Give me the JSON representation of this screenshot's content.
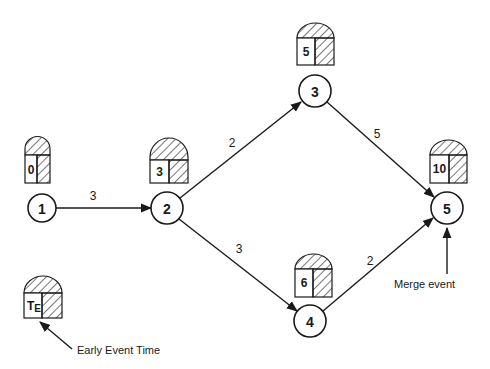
{
  "diagram": {
    "type": "PERT network",
    "nodes": [
      {
        "id": "1",
        "label": "1",
        "cx": 42,
        "cy": 208,
        "early_time": "0",
        "box": {
          "x": 25,
          "y": 136,
          "w": 25
        }
      },
      {
        "id": "2",
        "label": "2",
        "cx": 167,
        "cy": 208,
        "early_time": "3",
        "box": {
          "x": 150,
          "y": 138,
          "w": 38
        }
      },
      {
        "id": "3",
        "label": "3",
        "cx": 315,
        "cy": 92,
        "early_time": "5",
        "box": {
          "x": 297,
          "y": 24,
          "w": 37
        }
      },
      {
        "id": "4",
        "label": "4",
        "cx": 310,
        "cy": 321,
        "early_time": "6",
        "box": {
          "x": 295,
          "y": 252,
          "w": 37
        }
      },
      {
        "id": "5",
        "label": "5",
        "cx": 447,
        "cy": 208,
        "early_time": "10",
        "box": {
          "x": 430,
          "y": 138,
          "w": 37
        }
      }
    ],
    "edges": [
      {
        "from": "1",
        "to": "2",
        "duration": "3",
        "label_x": 93,
        "label_y": 196
      },
      {
        "from": "2",
        "to": "3",
        "duration": "2",
        "label_x": 232,
        "label_y": 143
      },
      {
        "from": "2",
        "to": "4",
        "duration": "3",
        "label_x": 239,
        "label_y": 249
      },
      {
        "from": "3",
        "to": "5",
        "duration": "5",
        "label_x": 377,
        "label_y": 134
      },
      {
        "from": "4",
        "to": "5",
        "duration": "2",
        "label_x": 370,
        "label_y": 261
      }
    ],
    "legend": {
      "symbol_label": "T",
      "symbol_subscript": "E",
      "box": {
        "x": 24,
        "y": 275,
        "w": 38
      },
      "description": "Early Event Time"
    },
    "annotations": [
      {
        "text": "Merge event",
        "target_node": "5"
      }
    ]
  }
}
